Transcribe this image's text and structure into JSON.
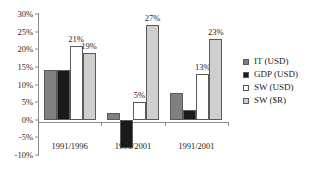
{
  "chart_data": {
    "type": "bar",
    "title": "",
    "xlabel": "",
    "ylabel": "",
    "categories": [
      "1991/1996",
      "1996/2001",
      "1991/2001"
    ],
    "series": [
      {
        "name": "IT (USD)",
        "color": "#808080",
        "values": [
          14,
          2,
          7.5
        ],
        "labels": [
          "",
          "",
          ""
        ]
      },
      {
        "name": "GDP (USD)",
        "color": "#1a1a1a",
        "values": [
          14,
          -8,
          2.7
        ],
        "labels": [
          "",
          "",
          ""
        ]
      },
      {
        "name": "SW (USD)",
        "color": "#ffffff",
        "values": [
          21,
          5,
          13
        ],
        "labels": [
          "21%",
          "5%",
          "13%"
        ]
      },
      {
        "name": "SW ($R)",
        "color": "#cfcfcf",
        "values": [
          19,
          27,
          23
        ],
        "labels": [
          "19%",
          "27%",
          "23%"
        ]
      }
    ],
    "ylim": [
      -10,
      30
    ],
    "ytick_values": [
      30,
      25,
      20,
      15,
      10,
      5,
      0,
      -5,
      -10
    ],
    "ytick_labels": [
      "30%",
      "25%",
      "20%",
      "15%",
      "10%",
      "5%",
      "0%",
      "-5%",
      "-10%"
    ],
    "grid": false,
    "legend_position": "right",
    "axis_color": "#8a8a8a",
    "bar_border_color": "#5a5a5a"
  },
  "legend": {
    "items": [
      {
        "label": "IT (USD)"
      },
      {
        "label": "GDP (USD)"
      },
      {
        "label": "SW (USD)"
      },
      {
        "label": "SW ($R)"
      }
    ]
  }
}
